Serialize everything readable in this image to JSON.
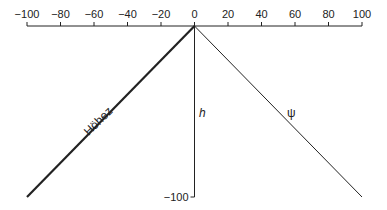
{
  "diagram": {
    "x_axis": {
      "min": -100,
      "max": 100,
      "ticks": [
        "-100",
        "-80",
        "-60",
        "-40",
        "-20",
        "0",
        "20",
        "40",
        "60",
        "80",
        "100"
      ],
      "tick_values": [
        -100,
        -80,
        -60,
        -40,
        -20,
        0,
        20,
        40,
        60,
        80,
        100
      ]
    },
    "vertical_axis": {
      "min_label": "-100",
      "min_value": -100
    },
    "lines": [
      {
        "name": "Höhez",
        "label": "Höhez",
        "from": [
          0,
          0
        ],
        "to": [
          -100,
          -100
        ],
        "weight": "bold"
      },
      {
        "name": "h",
        "label": "h",
        "from": [
          0,
          0
        ],
        "to": [
          0,
          -100
        ],
        "weight": "normal"
      },
      {
        "name": "psi",
        "label": "ψ",
        "from": [
          0,
          0
        ],
        "to": [
          100,
          -100
        ],
        "weight": "normal"
      }
    ],
    "colors": {
      "line": "#222222",
      "text": "#222222"
    }
  }
}
